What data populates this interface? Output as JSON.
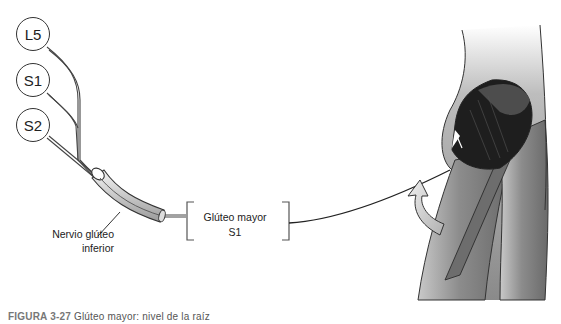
{
  "diagram": {
    "roots": [
      {
        "label": "L5"
      },
      {
        "label": "S1"
      },
      {
        "label": "S2"
      }
    ],
    "nerve": {
      "line1": "Nervio glúteo",
      "line2": "inferior"
    },
    "muscle": {
      "name": "Glúteo mayor",
      "root_level": "S1"
    },
    "illustration": "posterior view of hip and thigh with gluteus maximus exposed, curved arrow indicating hip extension",
    "caption": {
      "label": "FIGURA 3-27",
      "text": "Glúteo mayor: nivel de la raíz"
    },
    "colors": {
      "line": "#333333",
      "skin": "#9a9a9a",
      "muscle": "#1e1e1e",
      "arrow": "#d8d8d8"
    }
  }
}
